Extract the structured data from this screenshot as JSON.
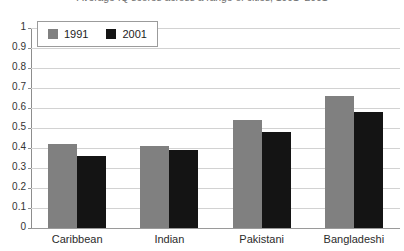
{
  "chart_data": {
    "type": "bar",
    "title": "Average IQ scores across a range of cities, 1991–2001",
    "xlabel": "",
    "ylabel": "",
    "ylim": [
      0,
      1
    ],
    "grid": true,
    "legend_position": "top-left",
    "categories": [
      "Caribbean",
      "Indian",
      "Pakistani",
      "Bangladeshi"
    ],
    "y_ticks": [
      "0",
      "0.1",
      "0.2",
      "0.3",
      "0.4",
      "0.5",
      "0.6",
      "0.7",
      "0.8",
      "0.9",
      "1"
    ],
    "series": [
      {
        "name": "1991",
        "color": "#808080",
        "values": [
          0.42,
          0.41,
          0.54,
          0.66
        ]
      },
      {
        "name": "2001",
        "color": "#141414",
        "values": [
          0.36,
          0.39,
          0.48,
          0.58
        ]
      }
    ]
  },
  "legend": {
    "items": [
      {
        "label": "1991",
        "swatch": "legend-swatch-1991"
      },
      {
        "label": "2001",
        "swatch": "legend-swatch-2001"
      }
    ]
  }
}
